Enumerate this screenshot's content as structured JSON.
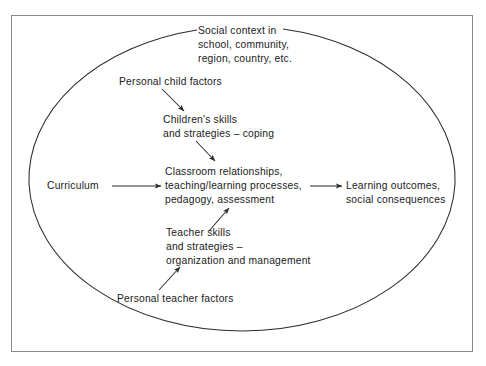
{
  "figure": {
    "type": "concept-diagram",
    "border_color": "#8a8a8a",
    "line_color": "#2b2b2b",
    "background": "#ffffff"
  },
  "boundary": {
    "shape": "ellipse",
    "label_node": "social_context"
  },
  "nodes": {
    "social_context": "Social context in\nschool, community,\nregion, country, etc.",
    "personal_child_factors": "Personal child factors",
    "childrens_skills": "Children's skills\nand strategies – coping",
    "curriculum": "Curriculum",
    "classroom": "Classroom relationships,\nteaching/learning processes,\npedagogy, assessment",
    "learning_outcomes": "Learning outcomes,\nsocial consequences",
    "teacher_skills": "Teacher skills\nand strategies –\norganization and management",
    "personal_teacher_factors": "Personal teacher factors"
  },
  "edges": [
    {
      "from": "personal_child_factors",
      "to": "childrens_skills",
      "direction": "down-right"
    },
    {
      "from": "childrens_skills",
      "to": "classroom",
      "direction": "down-right"
    },
    {
      "from": "curriculum",
      "to": "classroom",
      "direction": "right"
    },
    {
      "from": "classroom",
      "to": "learning_outcomes",
      "direction": "right"
    },
    {
      "from": "teacher_skills",
      "to": "classroom",
      "direction": "up-right"
    },
    {
      "from": "personal_teacher_factors",
      "to": "teacher_skills",
      "direction": "up-right"
    }
  ]
}
